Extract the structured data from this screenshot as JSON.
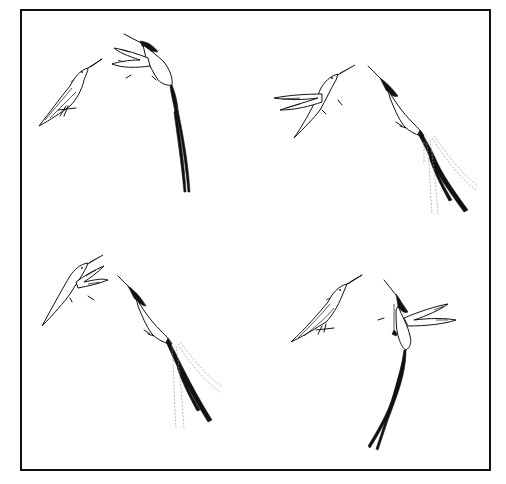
{
  "figure": {
    "panels": [
      {
        "position": "top-left",
        "small_bird": "perched, facing right",
        "long_tailed_bird": "hovering with wings forward, tail streamers hanging straight down"
      },
      {
        "position": "top-right",
        "small_bird": "hovering, wings spread left",
        "long_tailed_bird": "diving toward small bird, tail streamers swinging with motion lines"
      },
      {
        "position": "bottom-left",
        "small_bird": "hovering, wings raised",
        "long_tailed_bird": "diving, tail streamers swinging with motion lines"
      },
      {
        "position": "bottom-right",
        "small_bird": "perched, facing right",
        "long_tailed_bird": "hovering upright with wings spread right, long tail streamers hanging"
      }
    ],
    "colors": {
      "ink": "#111111",
      "motion_lines": "#9a9a9a",
      "background": "#ffffff"
    }
  }
}
